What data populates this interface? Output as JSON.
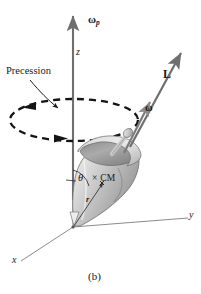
{
  "figure": {
    "caption": "(b)",
    "background_color": "#ffffff",
    "ink_color": "#1a1a1a",
    "axis_color": "#6b6b6b",
    "body_fill_light": "#e8e8e8",
    "body_fill_mid": "#c6c6c6",
    "body_fill_dark": "#9a9a9a"
  },
  "labels": {
    "omega_p": "ω",
    "omega_p_sub": "p",
    "z_axis": "z",
    "y_axis": "y",
    "x_axis": "x",
    "precession": "Precession",
    "angular_momentum": "L",
    "omega": "ω",
    "theta": "θ",
    "center_of_mass": "× CM",
    "radius_vector": "r"
  },
  "vectors": [
    {
      "name": "omega-p",
      "label": "ωp",
      "description": "precession angular velocity along +z",
      "from": [
        73,
        200
      ],
      "to": [
        73,
        14
      ],
      "color": "#6b6b6b"
    },
    {
      "name": "L",
      "label": "L",
      "description": "angular momentum along spin axis",
      "from": [
        128,
        148
      ],
      "to": [
        182,
        52
      ],
      "color": "#6b6b6b"
    },
    {
      "name": "omega",
      "label": "ω",
      "description": "spin angular velocity along same axis as L",
      "from": [
        124,
        152
      ],
      "to": [
        152,
        100
      ],
      "color": "#6b6b6b"
    },
    {
      "name": "r",
      "label": "r",
      "description": "position vector from origin to center of mass",
      "from": [
        73,
        227
      ],
      "to": [
        104,
        182
      ],
      "color": "#3a3a3a"
    }
  ],
  "precession_circle": {
    "name": "precession-path",
    "style": "dashed-ellipse",
    "center": [
      74,
      120
    ],
    "radius_x": 64,
    "radius_y": 21,
    "direction": "counterclockwise-viewed-from-above",
    "arrow_positions": [
      "left",
      "bottom-right"
    ]
  },
  "axes": {
    "z": {
      "from": [
        73,
        227
      ],
      "to": [
        73,
        28
      ]
    },
    "y": {
      "from": [
        73,
        227
      ],
      "to": [
        188,
        218
      ]
    },
    "x": {
      "from": [
        73,
        227
      ],
      "to": [
        20,
        262
      ]
    }
  },
  "angle": {
    "name": "theta",
    "symbol": "θ",
    "between": [
      "z-axis",
      "spin-axis"
    ],
    "vertex": [
      73,
      185
    ]
  },
  "top_body": {
    "name": "spinning-top",
    "description": "tilted conical spinning top with rim and axle",
    "apex": [
      74,
      226
    ],
    "rim_center": [
      108,
      150
    ],
    "tilt_degrees": 35
  }
}
